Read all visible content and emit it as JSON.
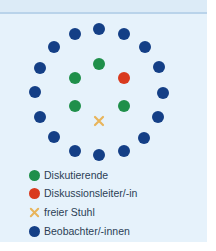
{
  "colors": {
    "discussant": "#1f8f4a",
    "moderator": "#d93a1e",
    "free_chair": "#e8b45a",
    "observer": "#143f86"
  },
  "diagram": {
    "outer_ring": [
      {
        "role": "observer",
        "x": 99,
        "y": 29
      },
      {
        "role": "observer",
        "x": 124,
        "y": 34
      },
      {
        "role": "observer",
        "x": 145,
        "y": 47
      },
      {
        "role": "observer",
        "x": 159,
        "y": 67
      },
      {
        "role": "observer",
        "x": 163,
        "y": 93
      },
      {
        "role": "observer",
        "x": 158,
        "y": 117
      },
      {
        "role": "observer",
        "x": 144,
        "y": 138
      },
      {
        "role": "observer",
        "x": 124,
        "y": 151
      },
      {
        "role": "observer",
        "x": 99,
        "y": 155
      },
      {
        "role": "observer",
        "x": 75,
        "y": 151
      },
      {
        "role": "observer",
        "x": 54,
        "y": 137
      },
      {
        "role": "observer",
        "x": 40,
        "y": 117
      },
      {
        "role": "observer",
        "x": 35,
        "y": 92
      },
      {
        "role": "observer",
        "x": 40,
        "y": 68
      },
      {
        "role": "observer",
        "x": 54,
        "y": 47
      },
      {
        "role": "observer",
        "x": 75,
        "y": 34
      }
    ],
    "inner_ring": [
      {
        "role": "discussant",
        "x": 99,
        "y": 64
      },
      {
        "role": "moderator",
        "x": 124,
        "y": 78
      },
      {
        "role": "discussant",
        "x": 124,
        "y": 106
      },
      {
        "role": "free_chair",
        "x": 99,
        "y": 121
      },
      {
        "role": "discussant",
        "x": 75,
        "y": 106
      },
      {
        "role": "discussant",
        "x": 75,
        "y": 78
      }
    ]
  },
  "legend": [
    {
      "role": "discussant",
      "marker": "circle",
      "label": "Diskutierende"
    },
    {
      "role": "moderator",
      "marker": "circle",
      "label": "Diskussionsleiter/-in"
    },
    {
      "role": "free_chair",
      "marker": "cross",
      "label": "freier Stuhl"
    },
    {
      "role": "observer",
      "marker": "circle",
      "label": "Beobachter/-innen"
    }
  ]
}
